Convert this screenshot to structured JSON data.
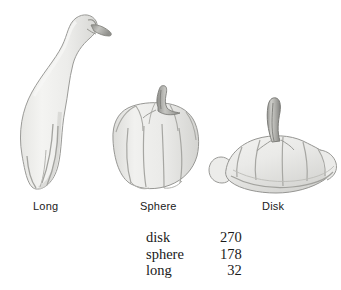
{
  "figure": {
    "background_color": "#ffffff",
    "specimens": [
      {
        "id": "long",
        "label": "Long",
        "icon": "long-gourd-illustration",
        "description": "swan-neck bottle gourd with bulbous base and long curved neck"
      },
      {
        "id": "sphere",
        "label": "Sphere",
        "icon": "sphere-gourd-illustration",
        "description": "round lobed pumpkin-shaped gourd with upright stem"
      },
      {
        "id": "disk",
        "label": "Disk",
        "icon": "disk-gourd-illustration",
        "description": "flattened wide scalloped squash with tall curved stem"
      }
    ],
    "colors": {
      "body_fill_light": "#f2f2f0",
      "body_fill_mid": "#e2e2df",
      "body_fill_shade": "#d2d2cf",
      "outline": "#9a9a97",
      "ridge_line": "#a8a8a4",
      "stem_light": "#c9c9c5",
      "stem_dark": "#8f8f8b",
      "text": "#1a1a1a"
    }
  },
  "counts": {
    "rows": [
      {
        "shape": "disk",
        "count": "270"
      },
      {
        "shape": "sphere",
        "count": "178"
      },
      {
        "shape": "long",
        "count": "32"
      }
    ]
  }
}
